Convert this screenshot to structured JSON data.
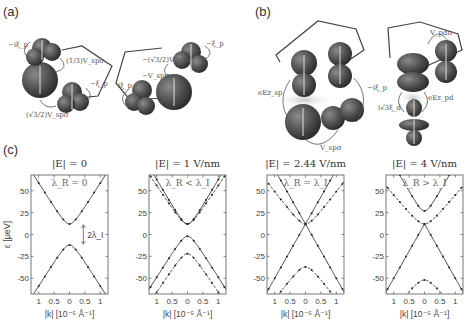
{
  "panels": {
    "a": {
      "label": "(a)",
      "annotations": [
        "−iξ_p",
        "(1/3)V_spσ",
        "−ξ_p",
        "(√3/2)V_spσ",
        "−(√3/2)V_spσ",
        "−ξ_p",
        "−V_spσ",
        "iξ_p"
      ]
    },
    "b": {
      "label": "(b)",
      "annotations": [
        "eEz_sp",
        "−iξ_p",
        "V_spσ",
        "V_pdπ",
        "i√3ξ_d",
        "eEz_pd"
      ]
    },
    "c": {
      "label": "(c)"
    }
  },
  "chart_data": [
    {
      "type": "line",
      "title": "|E| = 0",
      "subtitle": "λ_R = 0",
      "xlabel": "|k| [10⁻⁵ Å⁻¹]",
      "ylabel": "ε [μeV]",
      "xticks": [
        "1",
        "0.5",
        "0",
        "0.5",
        "1"
      ],
      "yticks": [
        50,
        25,
        0,
        -25,
        -50
      ],
      "ylim": [
        -68,
        68
      ],
      "xlim": [
        -1.25,
        1.25
      ],
      "annotation": "2λ_I",
      "series": [
        {
          "name": "conduction (degenerate)",
          "gap": 12,
          "slope": 56,
          "style": "solid"
        },
        {
          "name": "valence (degenerate)",
          "gap": -12,
          "slope": -56,
          "style": "solid"
        }
      ]
    },
    {
      "type": "line",
      "title": "|E| = 1 V/nm",
      "subtitle": "λ_R < λ_I",
      "xlabel": "|k| [10⁻⁵ Å⁻¹]",
      "xticks": [
        "1",
        "0.5",
        "0",
        "0.5",
        "1"
      ],
      "yticks": [
        50,
        25,
        0,
        -25,
        -50
      ],
      "ylim": [
        -68,
        68
      ],
      "xlim": [
        -1.25,
        1.25
      ],
      "series": [
        {
          "name": "c1",
          "gap": 12,
          "slope": 60,
          "style": "solid"
        },
        {
          "name": "c2",
          "gap": 12,
          "slope": 53,
          "style": "dashed"
        },
        {
          "name": "v1",
          "gap": -2,
          "slope": -56,
          "style": "solid"
        },
        {
          "name": "v2",
          "gap": -22,
          "slope": -53,
          "style": "dashed"
        }
      ]
    },
    {
      "type": "line",
      "title": "|E| = 2.44 V/nm",
      "subtitle": "λ_R = λ_I",
      "xlabel": "|k| [10⁻⁵ Å⁻¹]",
      "xticks": [
        "1",
        "0.5",
        "0",
        "0.5",
        "1"
      ],
      "yticks": [
        50,
        25,
        0,
        -25,
        -50
      ],
      "ylim": [
        -68,
        68
      ],
      "xlim": [
        -1.25,
        1.25
      ],
      "series": [
        {
          "name": "c1",
          "gap": 12,
          "slope": 62,
          "style": "solid",
          "linear": true
        },
        {
          "name": "c2",
          "gap": 12,
          "slope": 46,
          "style": "dashed"
        },
        {
          "name": "v1",
          "gap": 12,
          "slope": -62,
          "style": "solid",
          "linear": true
        },
        {
          "name": "v2",
          "gap": -37,
          "slope": -46,
          "style": "dashed"
        }
      ]
    },
    {
      "type": "line",
      "title": "|E| = 4 V/nm",
      "subtitle": "λ_R > λ_I",
      "xlabel": "|k| [10⁻⁵ Å⁻¹]",
      "xticks": [
        "1",
        "0.5",
        "0",
        "0.5",
        "1"
      ],
      "yticks": [
        50,
        25,
        0,
        -25,
        -50
      ],
      "ylim": [
        -68,
        68
      ],
      "xlim": [
        -1.25,
        1.25
      ],
      "series": [
        {
          "name": "c1",
          "gap": 27,
          "slope": 62,
          "style": "solid"
        },
        {
          "name": "c2",
          "gap": 12,
          "slope": 42,
          "style": "dashed"
        },
        {
          "name": "v1",
          "gap": 12,
          "slope": -62,
          "style": "solid",
          "cross": true
        },
        {
          "name": "v2",
          "gap": -52,
          "slope": -42,
          "style": "dashed"
        }
      ]
    }
  ]
}
